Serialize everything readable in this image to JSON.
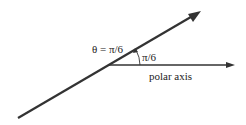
{
  "diagram": {
    "ray_label": "θ = π/6",
    "angle_label": "π/6",
    "axis_label": "polar axis",
    "colors": {
      "line": "#333333",
      "text": "#222222",
      "background": "#ffffff"
    }
  }
}
